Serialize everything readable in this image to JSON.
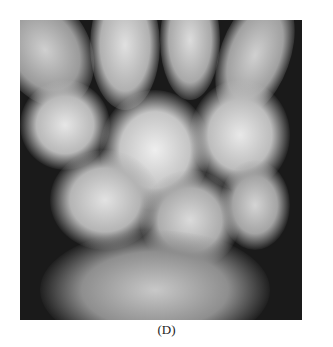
{
  "figure": {
    "label": "(D)",
    "image_description": "Wrist radiograph (X-ray) showing carpal bones",
    "colors": {
      "background": "#1a1a1a",
      "bone": "#d8d8d8",
      "page": "#ffffff"
    }
  }
}
